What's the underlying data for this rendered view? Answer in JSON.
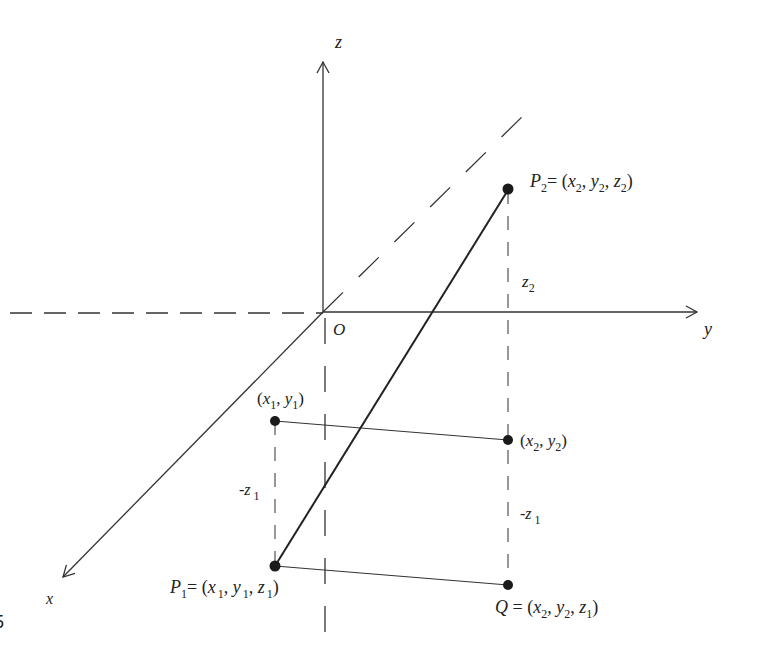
{
  "diagram": {
    "title": "",
    "axes": {
      "x_label": "x",
      "y_label": "y",
      "z_label": "z",
      "origin_label": "O"
    },
    "points": {
      "P2": {
        "name": "P",
        "sub": "2",
        "eq": "= (",
        "x": "x",
        "xs": "2",
        "y": "y",
        "ys": "2",
        "z": "z",
        "zs": "2",
        "close": ")"
      },
      "P1": {
        "name": "P",
        "sub": "1",
        "eq": "= (",
        "x": "x",
        "xs": "1",
        "y": "y",
        "ys": "1",
        "z": "z",
        "zs": "1",
        "close": ")"
      },
      "Q": {
        "name": "Q",
        "eq": " = (",
        "x": "x",
        "xs": "2",
        "y": "y",
        "ys": "2",
        "z": "z",
        "zs": "1",
        "close": ")"
      },
      "proj1": {
        "open": "(",
        "x": "x",
        "xs": "1",
        "y": "y",
        "ys": "1",
        "close": ")"
      },
      "proj2": {
        "open": "(",
        "x": "x",
        "xs": "2",
        "y": "y",
        "ys": "2",
        "close": ")"
      }
    },
    "segment_labels": {
      "z2": {
        "v": "z",
        "s": "2"
      },
      "neg_z1_left": {
        "minus": "-",
        "v": "z",
        "s": "1"
      },
      "neg_z1_right": {
        "minus": "-",
        "v": "z",
        "s": "1"
      }
    },
    "margin_text": "5",
    "colors": {
      "line": "#333333",
      "point": "#1a1a1a",
      "background": "#ffffff"
    }
  }
}
